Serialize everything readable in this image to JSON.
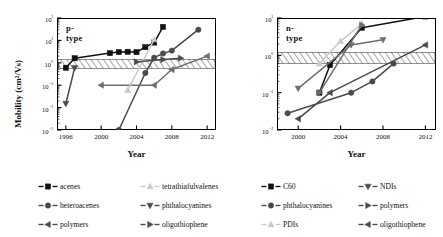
{
  "figure": {
    "axis_label_y": "Mobility (cm²/Vs)",
    "axis_label_x_left": "Year",
    "axis_label_x_right": "Year",
    "panel_label_left": "p-type",
    "panel_label_right": "n-type"
  },
  "colors": {
    "black": "#111111",
    "dark_gray": "#4a4a4a",
    "mid_gray": "#6e6e6e",
    "gray": "#8c8c8c",
    "light_gray": "#b5b5b5",
    "pale_gray": "#c9c9c9",
    "hatch": "#3a3a3a"
  },
  "ticks": {
    "left_y": [
      "10²",
      "10¹",
      "10⁰",
      "10⁻¹",
      "10⁻²",
      "10⁻³"
    ],
    "left_y_exp": [
      2,
      1,
      0,
      -1,
      -2,
      -3
    ],
    "left_x": [
      "1996",
      "2000",
      "2004",
      "2008",
      "2012"
    ],
    "right_y": [
      "10¹",
      "10⁰",
      "10⁻¹",
      "10⁻²"
    ],
    "right_y_exp": [
      1,
      0,
      -1,
      -2
    ],
    "right_x": [
      "2000",
      "2004",
      "2008",
      "2012"
    ]
  },
  "legend": {
    "left": [
      {
        "label": "acenes",
        "marker": "square",
        "color": "#111111"
      },
      {
        "label": "tetrathiafulvalenes",
        "marker": "triangle-up",
        "color": "#c9c9c9"
      },
      {
        "label": "heteroacenes",
        "marker": "circle",
        "color": "#4a4a4a"
      },
      {
        "label": "phthalocyanines",
        "marker": "triangle-down",
        "color": "#4a4a4a"
      },
      {
        "label": "polymers",
        "marker": "triangle-left",
        "color": "#4a4a4a"
      },
      {
        "label": "oligothiophene",
        "marker": "triangle-right",
        "color": "#4a4a4a"
      }
    ],
    "right": [
      {
        "label": "C60",
        "marker": "square",
        "color": "#111111"
      },
      {
        "label": "NDIs",
        "marker": "triangle-down",
        "color": "#4a4a4a"
      },
      {
        "label": "phthalocyanines",
        "marker": "circle",
        "color": "#4a4a4a"
      },
      {
        "label": "polymers",
        "marker": "triangle-right",
        "color": "#4a4a4a"
      },
      {
        "label": "PDIs",
        "marker": "triangle-up",
        "color": "#c9c9c9"
      },
      {
        "label": "oligothiophene",
        "marker": "triangle-left",
        "color": "#4a4a4a"
      }
    ]
  },
  "chart_data": {
    "type": "line",
    "panels": [
      {
        "name": "p-type",
        "title": "p-type",
        "xlabel": "Year",
        "ylabel": "Mobility (cm²/Vs)",
        "xlim": [
          1995,
          2013
        ],
        "ylim_log10": [
          -3,
          2
        ],
        "yscale": "log",
        "grid": false,
        "band_log10": [
          -0.25,
          0.15
        ],
        "series": [
          {
            "name": "acenes",
            "marker": "square",
            "color": "#111111",
            "x": [
              1996,
              1997,
              2001,
              2002,
              2003,
              2004,
              2005,
              2006,
              2007
            ],
            "y": [
              0.6,
              1.6,
              2.7,
              3.0,
              3.1,
              3.0,
              5.0,
              8.0,
              40.0
            ]
          },
          {
            "name": "heteroacenes",
            "marker": "circle",
            "color": "#4a4a4a",
            "x": [
              2002,
              2005,
              2006,
              2007,
              2008,
              2011
            ],
            "y": [
              0.001,
              0.35,
              1.7,
              2.6,
              3.5,
              30.0
            ]
          },
          {
            "name": "polymers",
            "marker": "triangle-left",
            "color": "#6e6e6e",
            "x": [
              2000,
              2006,
              2008,
              2012
            ],
            "y": [
              0.1,
              0.1,
              0.5,
              2.0
            ]
          },
          {
            "name": "tetrathiafulvalenes",
            "marker": "triangle-up",
            "color": "#c9c9c9",
            "x": [
              2003,
              2006
            ],
            "y": [
              0.06,
              11.0
            ]
          },
          {
            "name": "phthalocyanines",
            "marker": "triangle-down",
            "color": "#4a4a4a",
            "x": [
              1996,
              1997
            ],
            "y": [
              0.015,
              0.6
            ]
          },
          {
            "name": "oligothiophene",
            "marker": "triangle-right",
            "color": "#4a4a4a",
            "x": [
              2004,
              2007,
              2009
            ],
            "y": [
              1.1,
              1.4,
              1.6
            ]
          }
        ]
      },
      {
        "name": "n-type",
        "title": "n-type",
        "xlabel": "Year",
        "ylabel": "Mobility (cm²/Vs)",
        "xlim": [
          1998,
          2013
        ],
        "ylim_log10": [
          -2,
          1
        ],
        "yscale": "log",
        "grid": false,
        "band_log10": [
          -0.22,
          0.08
        ],
        "series": [
          {
            "name": "C60",
            "marker": "square",
            "color": "#111111",
            "x": [
              2002,
              2003,
              2006,
              2012
            ],
            "y": [
              0.1,
              0.55,
              5.5,
              11.0
            ]
          },
          {
            "name": "phthalocyanines",
            "marker": "circle",
            "color": "#4a4a4a",
            "x": [
              1999,
              2005,
              2007,
              2009
            ],
            "y": [
              0.028,
              0.1,
              0.2,
              0.6
            ]
          },
          {
            "name": "PDIs",
            "marker": "triangle-up",
            "color": "#c9c9c9",
            "x": [
              2002,
              2004,
              2006
            ],
            "y": [
              0.6,
              2.4,
              7.0
            ]
          },
          {
            "name": "NDIs",
            "marker": "triangle-down",
            "color": "#6e6e6e",
            "x": [
              2000,
              2005,
              2008
            ],
            "y": [
              0.13,
              1.9,
              2.6
            ]
          },
          {
            "name": "polymers",
            "marker": "triangle-right",
            "color": "#6e6e6e",
            "x": [
              2002,
              2006
            ],
            "y": [
              0.1,
              6.5
            ]
          },
          {
            "name": "oligothiophene",
            "marker": "triangle-left",
            "color": "#4a4a4a",
            "x": [
              2000,
              2003,
              2012
            ],
            "y": [
              0.02,
              0.1,
              1.9
            ]
          }
        ]
      }
    ]
  }
}
